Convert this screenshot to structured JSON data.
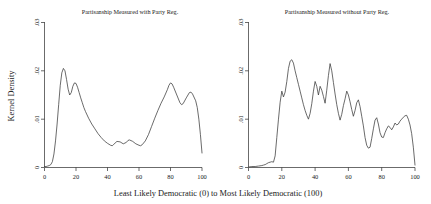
{
  "figure": {
    "width": 431,
    "height": 204,
    "background": "#ffffff",
    "line_color": "#3a3a3a",
    "axis_color": "#2b2b2b"
  },
  "shared_axis_title": "Least Likely Democratic (0) to Most Likely Democratic (100)",
  "y_axis_title": "Kernel Density",
  "chart_data": [
    {
      "type": "line",
      "title": "Partisanship Measured with Party Reg.",
      "xlabel": "Least Likely Democratic (0) to Most Likely Democratic (100)",
      "ylabel": "Kernel Density",
      "xlim": [
        0,
        100
      ],
      "ylim": [
        0,
        0.03
      ],
      "xticks": [
        0,
        20,
        40,
        60,
        80,
        100
      ],
      "xtick_labels": [
        "0",
        "20",
        "40",
        "60",
        "80",
        "100"
      ],
      "yticks": [
        0,
        0.01,
        0.02,
        0.03
      ],
      "ytick_labels": [
        "0",
        ".01",
        ".02",
        ".03"
      ],
      "grid": false,
      "legend": false,
      "series": [
        {
          "name": "Kernel density (with party registration)",
          "x": [
            0,
            1,
            2,
            3,
            4,
            5,
            6,
            7,
            8,
            9,
            10,
            11,
            12,
            13,
            14,
            15,
            16,
            17,
            18,
            19,
            20,
            21,
            22,
            23,
            24,
            25,
            26,
            28,
            30,
            32,
            34,
            36,
            38,
            40,
            42,
            43,
            44,
            46,
            48,
            50,
            52,
            53,
            54,
            56,
            58,
            60,
            61,
            62,
            64,
            66,
            68,
            70,
            72,
            74,
            76,
            78,
            79,
            80,
            81,
            82,
            84,
            86,
            87,
            88,
            90,
            92,
            93,
            94,
            96,
            97,
            98,
            99,
            100
          ],
          "y": [
            0.0002,
            0.0002,
            0.0003,
            0.0004,
            0.0006,
            0.0012,
            0.0028,
            0.0055,
            0.009,
            0.013,
            0.017,
            0.0196,
            0.0205,
            0.02,
            0.0182,
            0.0162,
            0.015,
            0.0155,
            0.0168,
            0.0175,
            0.0174,
            0.0166,
            0.0155,
            0.0144,
            0.0134,
            0.0124,
            0.0116,
            0.0102,
            0.009,
            0.008,
            0.007,
            0.0062,
            0.0055,
            0.005,
            0.0046,
            0.0045,
            0.0048,
            0.0054,
            0.0053,
            0.0049,
            0.0052,
            0.0056,
            0.0057,
            0.0054,
            0.0049,
            0.0046,
            0.0045,
            0.0047,
            0.0055,
            0.0068,
            0.0085,
            0.0102,
            0.0118,
            0.0133,
            0.0146,
            0.0161,
            0.017,
            0.0175,
            0.0173,
            0.0166,
            0.015,
            0.0134,
            0.013,
            0.0132,
            0.0144,
            0.0155,
            0.0156,
            0.0152,
            0.0138,
            0.0124,
            0.01,
            0.0068,
            0.003
          ]
        }
      ]
    },
    {
      "type": "line",
      "title": "Partisanship Measured without Party Reg.",
      "xlabel": "Least Likely Democratic (0) to Most Likely Democratic (100)",
      "ylabel": "Kernel Density",
      "xlim": [
        0,
        100
      ],
      "ylim": [
        0,
        0.03
      ],
      "xticks": [
        0,
        20,
        40,
        60,
        80,
        100
      ],
      "xtick_labels": [
        "0",
        "20",
        "40",
        "60",
        "80",
        "100"
      ],
      "yticks": [
        0,
        0.01,
        0.02,
        0.03
      ],
      "ytick_labels": [
        "0",
        ".01",
        ".02",
        ".03"
      ],
      "grid": false,
      "legend": false,
      "series": [
        {
          "name": "Kernel density (without party registration)",
          "x": [
            0,
            2,
            4,
            6,
            8,
            9,
            10,
            11,
            12,
            13,
            14,
            15,
            16,
            17,
            18,
            19,
            20,
            21,
            22,
            23,
            24,
            25,
            26,
            27,
            28,
            29,
            30,
            31,
            32,
            33,
            34,
            35,
            36,
            37,
            38,
            39,
            40,
            41,
            42,
            43,
            44,
            45,
            46,
            47,
            48,
            49,
            50,
            51,
            52,
            53,
            54,
            55,
            56,
            57,
            58,
            59,
            60,
            61,
            62,
            63,
            64,
            65,
            66,
            67,
            68,
            69,
            70,
            71,
            72,
            73,
            74,
            75,
            76,
            77,
            78,
            79,
            80,
            81,
            82,
            83,
            84,
            85,
            86,
            87,
            88,
            89,
            90,
            91,
            92,
            93,
            94,
            95,
            96,
            97,
            98,
            99,
            100
          ],
          "y": [
            0.0001,
            0.0002,
            0.0002,
            0.0003,
            0.0004,
            0.0005,
            0.0006,
            0.0008,
            0.001,
            0.0011,
            0.0012,
            0.0011,
            0.0024,
            0.0062,
            0.01,
            0.0135,
            0.0158,
            0.0146,
            0.0156,
            0.0178,
            0.0205,
            0.022,
            0.0223,
            0.0216,
            0.02,
            0.0186,
            0.0172,
            0.0158,
            0.0144,
            0.013,
            0.0118,
            0.0108,
            0.01,
            0.0112,
            0.0132,
            0.0158,
            0.0178,
            0.0168,
            0.015,
            0.0168,
            0.016,
            0.0147,
            0.0133,
            0.016,
            0.019,
            0.0215,
            0.02,
            0.0176,
            0.0152,
            0.013,
            0.0112,
            0.0098,
            0.011,
            0.0128,
            0.0142,
            0.0158,
            0.015,
            0.0136,
            0.012,
            0.0106,
            0.0118,
            0.0134,
            0.014,
            0.0126,
            0.0106,
            0.0086,
            0.0062,
            0.0046,
            0.004,
            0.0042,
            0.006,
            0.008,
            0.0098,
            0.0103,
            0.009,
            0.0072,
            0.0063,
            0.0062,
            0.0072,
            0.008,
            0.0086,
            0.0083,
            0.0078,
            0.0084,
            0.0092,
            0.0088,
            0.009,
            0.0096,
            0.01,
            0.0104,
            0.0107,
            0.0108,
            0.01,
            0.0088,
            0.007,
            0.0042,
            0.0005
          ]
        }
      ]
    }
  ],
  "panels": [
    {
      "id": "left",
      "title": "Partisanship Measured with Party Reg.",
      "x_tick_labels": [
        "0",
        "20",
        "40",
        "60",
        "80",
        "100"
      ],
      "y_tick_labels": [
        "0",
        ".01",
        ".02",
        ".03"
      ]
    },
    {
      "id": "right",
      "title": "Partisanship Measured without Party Reg.",
      "x_tick_labels": [
        "0",
        "20",
        "40",
        "60",
        "80",
        "100"
      ],
      "y_tick_labels": [
        "0",
        ".01",
        ".02",
        ".03"
      ]
    }
  ]
}
